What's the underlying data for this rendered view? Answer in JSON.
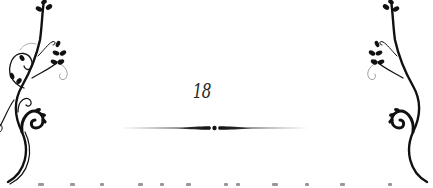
{
  "page": {
    "number": "18",
    "background_color": "#ffffff",
    "ink_color": "#111111"
  },
  "ornaments": {
    "left": "floral-vine-ornament",
    "right": "floral-vine-ornament-mirrored",
    "divider": "tapered-line-divider"
  },
  "cut_off_text": {
    "visible": "partial line cropped at bottom edge (illegible)"
  }
}
